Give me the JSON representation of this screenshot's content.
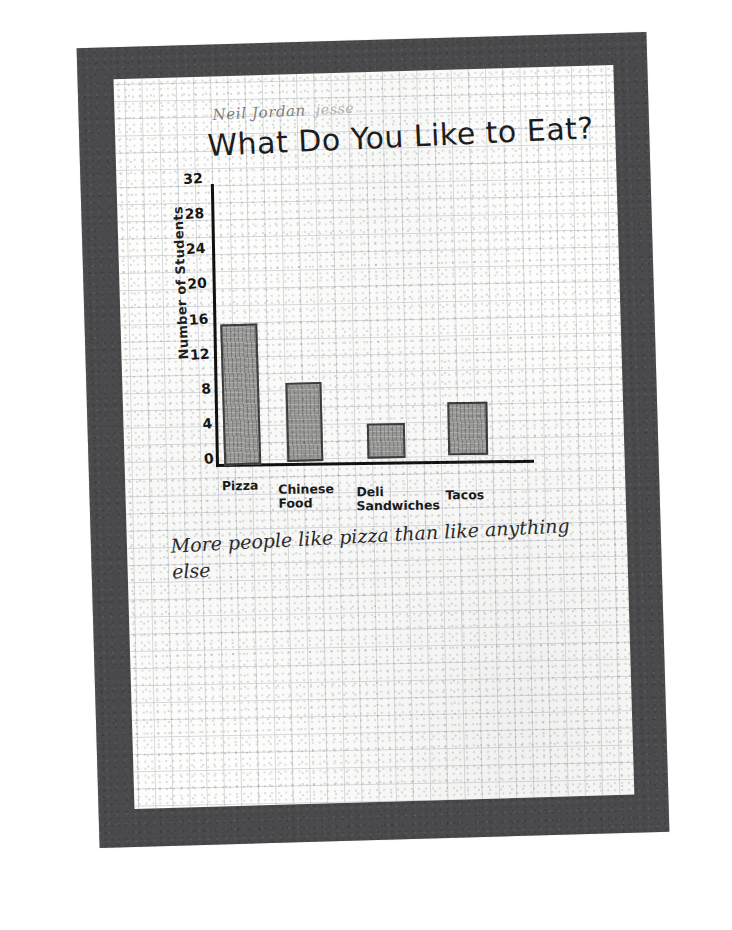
{
  "artifact": {
    "medium": "photograph of a hand-drawn student worksheet on graph paper",
    "frame_color": "#4a4a4c",
    "paper_color": "#fdfdfc",
    "grid_color": "#7e8c9c",
    "ink_color": "#1d1d1d",
    "bar_fill_color": "#9a9a98",
    "bar_outline_color": "#3b3b3b"
  },
  "header": {
    "names": "Neil Jordan",
    "name_faint": "jesse",
    "title": "What Do You Like to Eat?"
  },
  "caption": {
    "text": "More people like pizza than like anything else"
  },
  "chart_data": {
    "type": "bar",
    "title": "What Do You Like to Eat?",
    "xlabel": "",
    "ylabel": "Number of Students",
    "categories": [
      "Pizza",
      "Chinese\nFood",
      "Deli\nSandwiches",
      "Tacos"
    ],
    "values": [
      16,
      9,
      4,
      6
    ],
    "ylim": [
      0,
      32
    ],
    "yticks": [
      0,
      4,
      8,
      12,
      16,
      20,
      24,
      28,
      32
    ],
    "ytick_labels": [
      "0",
      "4",
      "8",
      "12",
      "16",
      "20",
      "24",
      "28",
      "32"
    ],
    "grid": true,
    "legend": null,
    "annotations": [
      "More people like pizza than like anything else"
    ]
  }
}
